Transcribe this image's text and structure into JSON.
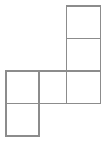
{
  "figure": {
    "background_color": "#ffffff",
    "stroke_color": "#8c8c8c",
    "fill_color": "#ffffff",
    "stroke_width": 1.1,
    "canvas": {
      "width": 107,
      "height": 141
    },
    "cell_size": {
      "width": 33,
      "height": 32.5
    },
    "square_count": 5,
    "squares": [
      {
        "id": "square-top-right",
        "label": "top right square",
        "grid_col": 3,
        "grid_row": 1,
        "x": 66.5,
        "y": 6.0,
        "width": 34.0,
        "height": 32.5
      },
      {
        "id": "square-upper-right",
        "label": "upper right square",
        "grid_col": 3,
        "grid_row": 2,
        "x": 66.5,
        "y": 38.5,
        "width": 34.0,
        "height": 32.5
      },
      {
        "id": "square-middle-right",
        "label": "middle right square",
        "grid_col": 3,
        "grid_row": 3,
        "x": 66.5,
        "y": 71.0,
        "width": 34.0,
        "height": 32.5
      },
      {
        "id": "square-middle-center",
        "label": "middle center square",
        "grid_col": 2,
        "grid_row": 3,
        "x": 39.0,
        "y": 71.0,
        "width": 27.5,
        "height": 32.5
      },
      {
        "id": "square-middle-left",
        "label": "middle left square",
        "grid_col": 1,
        "grid_row": 3,
        "x": 6.0,
        "y": 71.0,
        "width": 33.0,
        "height": 32.5
      },
      {
        "id": "square-bottom-left",
        "label": "bottom left square",
        "grid_col": 1,
        "grid_row": 4,
        "x": 6.0,
        "y": 103.5,
        "width": 33.0,
        "height": 32.5
      }
    ]
  }
}
